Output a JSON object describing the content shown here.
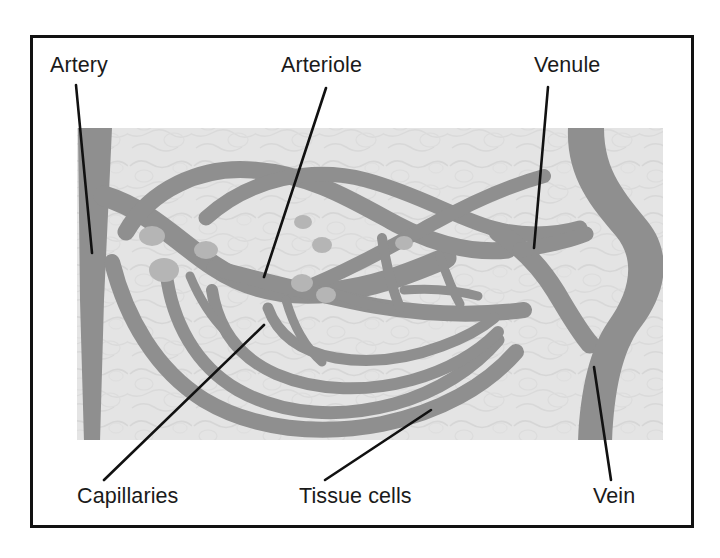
{
  "figure": {
    "border_color": "#111111",
    "background_color": "#ffffff",
    "tissue_color": "#e3e3e3",
    "vessel_color": "#8f8f8f",
    "sphincter_color": "#b5b5b5",
    "leader_color": "#111111"
  },
  "labels": [
    {
      "id": "artery",
      "text": "Artery",
      "text_x": 50,
      "text_y": 72,
      "anchor": "start",
      "leader": {
        "x1": 76,
        "y1": 85,
        "x2": 92,
        "y2": 253
      }
    },
    {
      "id": "arteriole",
      "text": "Arteriole",
      "text_x": 281,
      "text_y": 72,
      "anchor": "start",
      "leader": {
        "x1": 326,
        "y1": 88,
        "x2": 264,
        "y2": 277
      }
    },
    {
      "id": "venule",
      "text": "Venule",
      "text_x": 534,
      "text_y": 72,
      "anchor": "start",
      "leader": {
        "x1": 548,
        "y1": 87,
        "x2": 534,
        "y2": 248
      }
    },
    {
      "id": "capillaries",
      "text": "Capillaries",
      "text_x": 77,
      "text_y": 503,
      "anchor": "start",
      "leader": {
        "x1": 104,
        "y1": 480,
        "x2": 264,
        "y2": 325
      }
    },
    {
      "id": "tissue-cells",
      "text": "Tissue cells",
      "text_x": 299,
      "text_y": 503,
      "anchor": "start",
      "leader": {
        "x1": 325,
        "y1": 480,
        "x2": 431,
        "y2": 410
      }
    },
    {
      "id": "vein",
      "text": "Vein",
      "text_x": 593,
      "text_y": 503,
      "anchor": "start",
      "leader": {
        "x1": 611,
        "y1": 480,
        "x2": 594,
        "y2": 367
      }
    }
  ],
  "tissue_region": {
    "x": 77,
    "y": 128,
    "width": 586,
    "height": 312
  },
  "border_rect": {
    "x": 30,
    "y": 35,
    "width": 664,
    "height": 493,
    "stroke_width": 3
  }
}
